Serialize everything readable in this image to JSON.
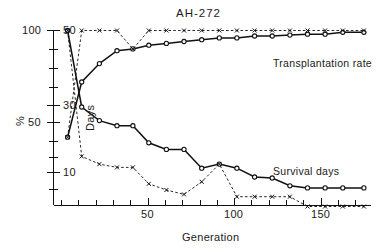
{
  "figure": {
    "title": "AH-272",
    "x_axis": {
      "label": "Generation",
      "ticks": [
        50,
        100,
        150
      ],
      "tick_labels": [
        "50",
        "100",
        "150"
      ],
      "range": [
        0,
        180
      ],
      "minor_tick_step": 10
    },
    "y_axis_left": {
      "label": "%",
      "ticks": [
        100,
        50
      ],
      "tick_labels": [
        "100",
        "50"
      ],
      "range": [
        0,
        100
      ]
    },
    "y_axis_right": {
      "label": "Days",
      "ticks": [
        50,
        30,
        10
      ],
      "tick_labels": [
        "50",
        "30",
        "10"
      ],
      "scale": "log",
      "range": [
        4,
        55
      ]
    },
    "series_labels": {
      "transplantation": "Transplantation rate",
      "survival": "Survival days"
    },
    "legend_note_transplantation": "Transplantation rate",
    "legend_note_survival": "Survival days"
  },
  "chart_data": {
    "type": "line",
    "title": "AH-272",
    "xlabel": "Generation",
    "ylabel": "%",
    "ylabel_secondary": "Days",
    "xlim": [
      0,
      180
    ],
    "ylim_percent": [
      0,
      100
    ],
    "ylim_days": [
      4,
      55
    ],
    "days_scale": "log",
    "grid": false,
    "legend_position": "inline-right",
    "series": [
      {
        "name": "Transplantation rate",
        "axis": "percent",
        "marker": "circle-open",
        "line": "solid",
        "x": [
          8,
          16,
          26,
          36,
          45,
          54,
          64,
          74,
          84,
          94,
          104,
          114,
          124,
          134,
          144,
          154,
          164,
          176
        ],
        "values": [
          42,
          72,
          82,
          89,
          90,
          92,
          93,
          94,
          95,
          96,
          96,
          97,
          97,
          97.5,
          98,
          98,
          99,
          99
        ]
      },
      {
        "name": "Transplantation rate (alt)",
        "axis": "percent",
        "marker": "cross",
        "line": "dashed",
        "x": [
          8,
          16,
          26,
          36,
          45,
          54,
          64,
          74,
          84,
          94,
          104,
          114,
          124,
          134,
          144,
          154,
          164,
          176
        ],
        "values": [
          42,
          100,
          100,
          100,
          90,
          100,
          100,
          100,
          100,
          100,
          100,
          100,
          100,
          100,
          100,
          100,
          100,
          100
        ]
      },
      {
        "name": "Survival days",
        "axis": "days",
        "marker": "circle-open",
        "line": "solid",
        "x": [
          8,
          16,
          26,
          36,
          45,
          54,
          64,
          74,
          84,
          94,
          104,
          114,
          124,
          134,
          144,
          154,
          164,
          176
        ],
        "values": [
          50,
          21,
          18,
          17,
          17,
          14,
          13,
          13,
          10.5,
          11,
          10.5,
          9.5,
          9.4,
          8.6,
          8.4,
          8.4,
          8.4,
          8.4
        ]
      },
      {
        "name": "Survival days (alt)",
        "axis": "days",
        "marker": "cross",
        "line": "dashed",
        "x": [
          8,
          16,
          26,
          36,
          45,
          54,
          64,
          74,
          84,
          94,
          104,
          114,
          124,
          134,
          144,
          154,
          164,
          176
        ],
        "values": [
          50,
          12,
          11,
          10.6,
          10.6,
          8.8,
          8.2,
          7.8,
          9.0,
          11,
          7.6,
          7.6,
          7.6,
          7.6,
          6.8,
          6.8,
          6.8,
          6.8
        ]
      }
    ]
  }
}
